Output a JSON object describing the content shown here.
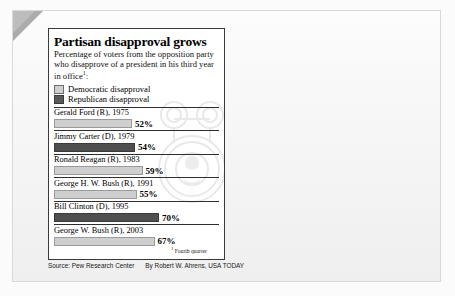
{
  "chart_data": {
    "type": "bar",
    "title": "Partisan disapproval grows",
    "subtitle": "Percentage of voters from the opposition party who disapprove of a president in his third year in office",
    "subtitle_footnote_marker": "1",
    "orientation": "horizontal",
    "categories": [
      "Gerald Ford (R), 1975",
      "Jimmy Carter (D), 1979",
      "Ronald Reagan (R), 1983",
      "George H. W. Bush (R), 1991",
      "Bill Clinton (D), 1995",
      "George W. Bush (R), 2003"
    ],
    "values": [
      52,
      54,
      59,
      55,
      70,
      67
    ],
    "value_labels": [
      "52%",
      "54%",
      "59%",
      "55%",
      "70%",
      "67%"
    ],
    "series_of_bar": [
      "democratic",
      "republican",
      "democratic",
      "democratic",
      "republican",
      "democratic"
    ],
    "xlabel": "",
    "ylabel": "",
    "xlim": [
      0,
      100
    ],
    "grid": false,
    "legend_position": "top-left",
    "legend": [
      {
        "key": "democratic",
        "label": "Democratic disapproval",
        "color": "#cfcfcf"
      },
      {
        "key": "republican",
        "label": "Republican disapproval",
        "color": "#4f4f4f"
      }
    ],
    "annotations": [
      {
        "marker": "1",
        "text": "Fourth quarter"
      }
    ]
  },
  "footnote": {
    "marker": "1",
    "text": "Fourth quarter"
  },
  "source": {
    "source_text": "Source: Pew Research Center",
    "credit_text": "By Robert W. Ahrens, USA TODAY"
  },
  "colors": {
    "democratic_bar": "#cfcfcf",
    "republican_bar": "#4f4f4f",
    "card_background": "#ffffff",
    "page_background": "#f4f4f4"
  }
}
